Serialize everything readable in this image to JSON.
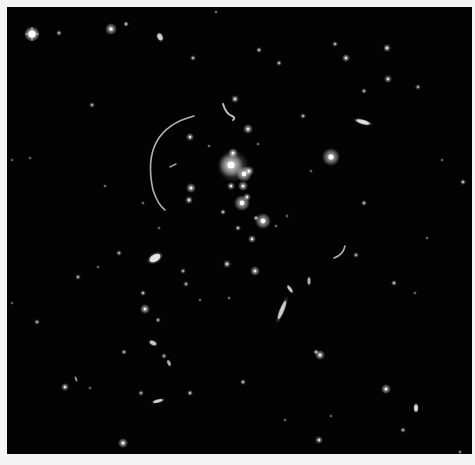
{
  "image": {
    "subject": "galaxy cluster with gravitational lensing arcs",
    "background": "#030303",
    "border": "#f4f4f4",
    "field": {
      "x": 7,
      "y": 7,
      "w": 465,
      "h": 447
    }
  },
  "bright_star": {
    "x": 32,
    "y": 34,
    "r": 3.5
  },
  "arcs": [
    {
      "d": "M 194 116 Q 140 130 153 190 Q 158 205 165 210",
      "w": 1.6,
      "o": 0.8
    },
    {
      "d": "M 223 104 Q 226 114 232 116 Q 236 118 233 120",
      "w": 2,
      "o": 0.85
    },
    {
      "d": "M 345 246 Q 343 255 334 258",
      "w": 1.6,
      "o": 0.8
    },
    {
      "d": "M 176 164 L 170 167",
      "w": 1.5,
      "o": 0.7
    }
  ],
  "elongated": [
    {
      "x": 363,
      "y": 122,
      "rx": 7,
      "ry": 2,
      "rot": 15,
      "o": 0.85
    },
    {
      "x": 282,
      "y": 310,
      "rx": 10,
      "ry": 2,
      "rot": -68,
      "o": 0.75
    },
    {
      "x": 290,
      "y": 289,
      "rx": 4,
      "ry": 1.5,
      "rot": 55,
      "o": 0.7
    },
    {
      "x": 155,
      "y": 258,
      "rx": 6,
      "ry": 3.5,
      "rot": -30,
      "o": 0.9
    },
    {
      "x": 158,
      "y": 401,
      "rx": 5,
      "ry": 1.5,
      "rot": -15,
      "o": 0.75
    },
    {
      "x": 153,
      "y": 343,
      "rx": 3.5,
      "ry": 2,
      "rot": 25,
      "o": 0.7
    },
    {
      "x": 169,
      "y": 363,
      "rx": 3,
      "ry": 1.5,
      "rot": 65,
      "o": 0.6
    },
    {
      "x": 416,
      "y": 408,
      "rx": 2,
      "ry": 3.5,
      "rot": 0,
      "o": 0.8
    },
    {
      "x": 160,
      "y": 37,
      "rx": 2.5,
      "ry": 3.5,
      "rot": -25,
      "o": 0.75
    },
    {
      "x": 309,
      "y": 281,
      "rx": 1.5,
      "ry": 3.5,
      "rot": 0,
      "o": 0.6
    },
    {
      "x": 76,
      "y": 379,
      "rx": 1,
      "ry": 2.5,
      "rot": -20,
      "o": 0.5
    }
  ],
  "galaxies": [
    {
      "x": 231,
      "y": 165,
      "r": 6,
      "o": 1
    },
    {
      "x": 233,
      "y": 153,
      "r": 2.5,
      "o": 0.9
    },
    {
      "x": 244,
      "y": 174,
      "r": 4,
      "o": 0.95
    },
    {
      "x": 249,
      "y": 171,
      "r": 2.5,
      "o": 0.85
    },
    {
      "x": 243,
      "y": 186,
      "r": 2.5,
      "o": 0.85
    },
    {
      "x": 231,
      "y": 186,
      "r": 2,
      "o": 0.8
    },
    {
      "x": 242,
      "y": 203,
      "r": 4,
      "o": 0.95
    },
    {
      "x": 247,
      "y": 197,
      "r": 2,
      "o": 0.8
    },
    {
      "x": 263,
      "y": 221,
      "r": 4,
      "o": 0.95
    },
    {
      "x": 256,
      "y": 218,
      "r": 1.5,
      "o": 0.7
    },
    {
      "x": 248,
      "y": 129,
      "r": 2.5,
      "o": 0.85
    },
    {
      "x": 235,
      "y": 99,
      "r": 2,
      "o": 0.75
    },
    {
      "x": 191,
      "y": 188,
      "r": 2.5,
      "o": 0.85
    },
    {
      "x": 189,
      "y": 200,
      "r": 2,
      "o": 0.8
    },
    {
      "x": 190,
      "y": 137,
      "r": 2,
      "o": 0.8
    },
    {
      "x": 223,
      "y": 212,
      "r": 1.5,
      "o": 0.7
    },
    {
      "x": 252,
      "y": 239,
      "r": 2,
      "o": 0.8
    },
    {
      "x": 238,
      "y": 228,
      "r": 1.5,
      "o": 0.7
    },
    {
      "x": 255,
      "y": 271,
      "r": 2.5,
      "o": 0.8
    },
    {
      "x": 227,
      "y": 264,
      "r": 2,
      "o": 0.75
    },
    {
      "x": 331,
      "y": 157,
      "r": 4.5,
      "o": 0.95
    },
    {
      "x": 111,
      "y": 29,
      "r": 3,
      "o": 0.9
    },
    {
      "x": 126,
      "y": 24,
      "r": 1.5,
      "o": 0.7
    },
    {
      "x": 59,
      "y": 33,
      "r": 1.5,
      "o": 0.65
    },
    {
      "x": 145,
      "y": 309,
      "r": 2.5,
      "o": 0.85
    },
    {
      "x": 143,
      "y": 293,
      "r": 1.5,
      "o": 0.7
    },
    {
      "x": 123,
      "y": 443,
      "r": 2.5,
      "o": 0.9
    },
    {
      "x": 65,
      "y": 387,
      "r": 2,
      "o": 0.8
    },
    {
      "x": 190,
      "y": 393,
      "r": 1.5,
      "o": 0.7
    },
    {
      "x": 141,
      "y": 393,
      "r": 1.5,
      "o": 0.6
    },
    {
      "x": 243,
      "y": 382,
      "r": 1.5,
      "o": 0.7
    },
    {
      "x": 320,
      "y": 355,
      "r": 2.5,
      "o": 0.85
    },
    {
      "x": 316,
      "y": 352,
      "r": 1.5,
      "o": 0.7
    },
    {
      "x": 386,
      "y": 389,
      "r": 2.5,
      "o": 0.85
    },
    {
      "x": 319,
      "y": 440,
      "r": 2,
      "o": 0.75
    },
    {
      "x": 394,
      "y": 283,
      "r": 1.5,
      "o": 0.7
    },
    {
      "x": 387,
      "y": 48,
      "r": 2,
      "o": 0.8
    },
    {
      "x": 346,
      "y": 58,
      "r": 2,
      "o": 0.8
    },
    {
      "x": 388,
      "y": 79,
      "r": 2,
      "o": 0.75
    },
    {
      "x": 335,
      "y": 44,
      "r": 1.5,
      "o": 0.65
    },
    {
      "x": 364,
      "y": 91,
      "r": 1.5,
      "o": 0.6
    },
    {
      "x": 418,
      "y": 87,
      "r": 1.5,
      "o": 0.6
    },
    {
      "x": 463,
      "y": 182,
      "r": 1.5,
      "o": 0.7
    },
    {
      "x": 364,
      "y": 203,
      "r": 1.5,
      "o": 0.65
    },
    {
      "x": 303,
      "y": 116,
      "r": 1.5,
      "o": 0.65
    },
    {
      "x": 259,
      "y": 50,
      "r": 1.5,
      "o": 0.7
    },
    {
      "x": 279,
      "y": 63,
      "r": 1.5,
      "o": 0.65
    },
    {
      "x": 193,
      "y": 58,
      "r": 1.5,
      "o": 0.65
    },
    {
      "x": 92,
      "y": 105,
      "r": 1.5,
      "o": 0.6
    },
    {
      "x": 105,
      "y": 186,
      "r": 1,
      "o": 0.55
    },
    {
      "x": 78,
      "y": 277,
      "r": 1.5,
      "o": 0.6
    },
    {
      "x": 37,
      "y": 322,
      "r": 1.5,
      "o": 0.6
    },
    {
      "x": 98,
      "y": 267,
      "r": 1,
      "o": 0.5
    },
    {
      "x": 119,
      "y": 253,
      "r": 1.5,
      "o": 0.6
    },
    {
      "x": 143,
      "y": 203,
      "r": 1,
      "o": 0.55
    },
    {
      "x": 159,
      "y": 228,
      "r": 1,
      "o": 0.5
    },
    {
      "x": 186,
      "y": 284,
      "r": 1.5,
      "o": 0.6
    },
    {
      "x": 183,
      "y": 271,
      "r": 1.5,
      "o": 0.6
    },
    {
      "x": 164,
      "y": 356,
      "r": 1.5,
      "o": 0.6
    },
    {
      "x": 124,
      "y": 352,
      "r": 1.5,
      "o": 0.6
    },
    {
      "x": 158,
      "y": 320,
      "r": 1.5,
      "o": 0.6
    },
    {
      "x": 90,
      "y": 388,
      "r": 1,
      "o": 0.5
    },
    {
      "x": 216,
      "y": 12,
      "r": 1,
      "o": 0.55
    },
    {
      "x": 403,
      "y": 430,
      "r": 1.5,
      "o": 0.6
    },
    {
      "x": 460,
      "y": 452,
      "r": 1.2,
      "o": 0.55
    },
    {
      "x": 285,
      "y": 420,
      "r": 1,
      "o": 0.5
    },
    {
      "x": 331,
      "y": 416,
      "r": 1,
      "o": 0.5
    },
    {
      "x": 356,
      "y": 255,
      "r": 1.5,
      "o": 0.6
    },
    {
      "x": 415,
      "y": 293,
      "r": 1,
      "o": 0.5
    },
    {
      "x": 427,
      "y": 238,
      "r": 1,
      "o": 0.5
    },
    {
      "x": 442,
      "y": 160,
      "r": 1,
      "o": 0.5
    },
    {
      "x": 229,
      "y": 298,
      "r": 1,
      "o": 0.55
    },
    {
      "x": 200,
      "y": 300,
      "r": 1,
      "o": 0.5
    },
    {
      "x": 276,
      "y": 226,
      "r": 1,
      "o": 0.55
    },
    {
      "x": 287,
      "y": 216,
      "r": 1,
      "o": 0.5
    },
    {
      "x": 311,
      "y": 171,
      "r": 1,
      "o": 0.5
    },
    {
      "x": 209,
      "y": 146,
      "r": 1,
      "o": 0.55
    },
    {
      "x": 258,
      "y": 144,
      "r": 1,
      "o": 0.55
    },
    {
      "x": 12,
      "y": 160,
      "r": 1,
      "o": 0.45
    },
    {
      "x": 30,
      "y": 158,
      "r": 1,
      "o": 0.5
    },
    {
      "x": 12,
      "y": 303,
      "r": 1,
      "o": 0.45
    }
  ]
}
